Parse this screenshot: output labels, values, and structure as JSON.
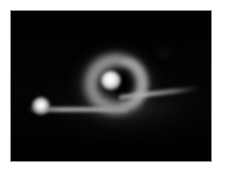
{
  "figure": {
    "caption": "Ring-shaped nebula with bright knot and a linear filament with an embedded point source",
    "frame_background": "#ffffff",
    "field_background": "#010101",
    "plate_border_color": "#8d8d8d",
    "width_px": 225,
    "height_px": 176
  },
  "field": {
    "label": "image-field",
    "left_px": 11,
    "top_px": 11,
    "width_px": 200,
    "height_px": 150
  },
  "objects": {
    "ring_nebula": {
      "label": "ring-nebula",
      "description": "C-shaped annular nebula, opening toward upper-left",
      "center_x_px": 105,
      "center_y_px": 73,
      "outer_diameter_px": 66,
      "color": "#a8a8a8",
      "peak_color": "#bababa"
    },
    "bright_knot": {
      "label": "bright-knot",
      "description": "Bright unresolved condensation on inner upper-left rim",
      "center_x_px": 100,
      "center_y_px": 70,
      "diameter_px": 20,
      "color": "#ffffff"
    },
    "ring_cavity": {
      "label": "ring-cavity",
      "description": "Dark central cavity offset to the right of ring center",
      "center_x_px": 111,
      "center_y_px": 73,
      "color": "#000000"
    },
    "filament": {
      "label": "filament",
      "description": "Long thin horizontal streak rising slightly toward the right",
      "start_x_px": 28,
      "start_y_px": 109,
      "end_x_px": 198,
      "end_y_px": 88,
      "color": "#b0b0b0"
    },
    "point_source": {
      "label": "point-source",
      "description": "Compact bright star-like source on the left end of the filament",
      "center_x_px": 41,
      "center_y_px": 106,
      "diameter_px": 18,
      "color": "#ffffff"
    },
    "faint_smudge": {
      "label": "faint-smudge",
      "description": "Very faint diffuse patch in the upper-right quadrant",
      "center_x_px": 164,
      "center_y_px": 53,
      "color": "#6e6e6e"
    },
    "diffuse_halo": {
      "label": "diffuse-halo",
      "description": "Low surface-brightness glow surrounding the filament",
      "color": "#6e6e6e"
    }
  }
}
